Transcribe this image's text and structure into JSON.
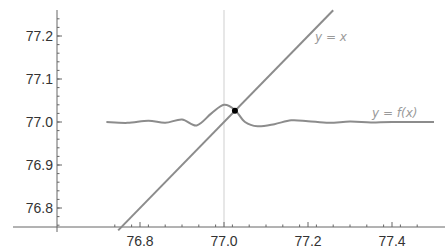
{
  "chart_data": {
    "type": "line",
    "title": "",
    "xlabel": "",
    "ylabel": "",
    "xlim": [
      76.72,
      77.5
    ],
    "ylim": [
      76.75,
      77.25
    ],
    "grid": false,
    "legend": "inline labels",
    "x_ticks": [
      76.8,
      77.0,
      77.2,
      77.4
    ],
    "x_tick_labels": [
      "76.8",
      "77.0",
      "77.2",
      "77.4"
    ],
    "y_ticks": [
      76.8,
      76.9,
      77.0,
      77.1,
      77.2
    ],
    "y_tick_labels": [
      "76.8",
      "76.9",
      "77.0",
      "77.1",
      "77.2"
    ],
    "vertical_guide_x": 77.0,
    "series": [
      {
        "name": "y = x",
        "label": "y = x",
        "type": "line",
        "x": [
          76.748,
          77.26
        ],
        "y": [
          76.748,
          77.26
        ]
      },
      {
        "name": "y = f(x)",
        "label": "y = f(x)",
        "type": "line",
        "description": "damped oscillation around 77.0 with a peak near x=77.0",
        "x": [
          76.72,
          76.77,
          76.82,
          76.86,
          76.9,
          76.935,
          76.97,
          77.0,
          77.026,
          77.05,
          77.08,
          77.12,
          77.16,
          77.2,
          77.25,
          77.3,
          77.35,
          77.4,
          77.5
        ],
        "y": [
          77.0,
          76.998,
          77.003,
          76.998,
          77.006,
          76.992,
          77.02,
          77.04,
          77.028,
          77.0,
          76.99,
          76.995,
          77.004,
          77.002,
          76.998,
          77.001,
          76.999,
          77.0,
          77.0
        ]
      }
    ],
    "annotations": [
      {
        "type": "point",
        "label": "fixed point",
        "x": 77.026,
        "y": 77.026,
        "color": "#000000"
      }
    ]
  },
  "labels": {
    "yx": "y = x",
    "yfx": "y = f(x)"
  },
  "colors": {
    "curve": "#8c8c8c",
    "axis": "#666666",
    "guide": "#cfcfcf",
    "point": "#000000",
    "label": "#9a9a9a"
  }
}
